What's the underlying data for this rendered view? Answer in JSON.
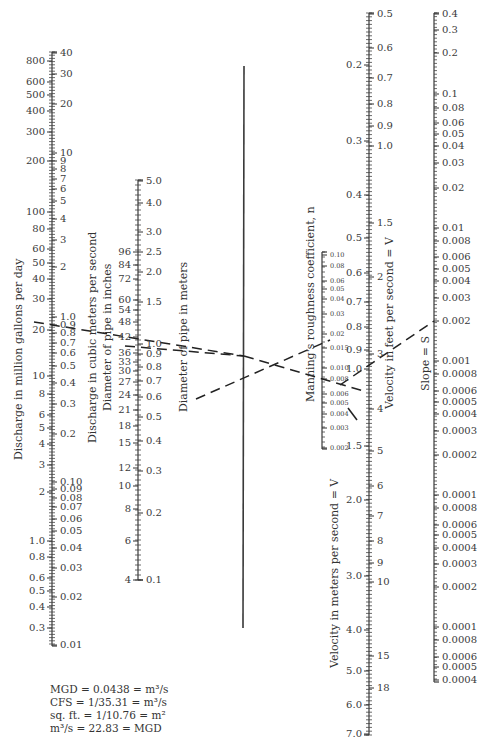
{
  "figure": {
    "type": "alignment-nomograph",
    "axes": [
      {
        "id": "discharge",
        "left_title": "Discharge in million gallons per day",
        "right_title": "Discharge in cubic meters per second",
        "left_ticks": [
          "800",
          "600",
          "500",
          "400",
          "300",
          "200",
          "100",
          "80",
          "60",
          "50",
          "40",
          "30",
          "20",
          "10",
          "8",
          "6",
          "5",
          "4",
          "3",
          "2",
          "1.0",
          "0.8",
          "0.6",
          "0.5",
          "0.4",
          "0.3"
        ],
        "right_ticks": [
          "40",
          "30",
          "20",
          "10",
          "9",
          "8",
          "7",
          "6",
          "5",
          "4",
          "3",
          "2",
          "1.0",
          "0.9",
          "0.8",
          "0.7",
          "0.6",
          "0.5",
          "0.4",
          "0.3",
          "0.2",
          "0.10",
          "0.09",
          "0.08",
          "0.07",
          "0.06",
          "0.05",
          "0.04",
          "0.03",
          "0.02",
          "0.01"
        ]
      },
      {
        "id": "pipe-diameter",
        "left_title": "Diameter of pipe in inches",
        "right_title": "Diameter of pipe in meters",
        "left_ticks": [
          "96",
          "84",
          "72",
          "60",
          "54",
          "48",
          "42",
          "36",
          "33",
          "30",
          "27",
          "24",
          "21",
          "18",
          "15",
          "12",
          "10",
          "8",
          "6",
          "4"
        ],
        "right_ticks": [
          "5.0",
          "4.0",
          "3.0",
          "2.5",
          "2.0",
          "1.5",
          "1.0",
          "0.9",
          "0.8",
          "0.7",
          "0.6",
          "0.5",
          "0.4",
          "0.3",
          "0.2",
          "0.1"
        ]
      },
      {
        "id": "turning-line",
        "left_title": "",
        "right_title": ""
      },
      {
        "id": "manning-n",
        "left_title": "Manning's roughness coefficient, n",
        "right_title": "",
        "right_ticks": [
          "0.10",
          "0.08",
          "0.06",
          "0.05",
          "0.04",
          "0.03",
          "0.02",
          "0.015",
          "0.010",
          "0.008",
          "0.006",
          "0.005",
          "0.004",
          "0.003",
          "0.002"
        ]
      },
      {
        "id": "velocity",
        "left_title": "Velocity in meters per second = V",
        "right_title": "Velocity in feet per second = V",
        "left_ticks": [
          "0.2",
          "0.3",
          "0.4",
          "0.5",
          "0.6",
          "0.7",
          "0.8",
          "0.9",
          "1.0",
          "1.5",
          "2.0",
          "3.0",
          "4.0",
          "5.0",
          "6.0",
          "7.0"
        ],
        "right_ticks": [
          "0.5",
          "0.6",
          "0.7",
          "0.8",
          "0.9",
          "1.0",
          "1.5",
          "2",
          "3",
          "4",
          "5",
          "6",
          "7",
          "8",
          "9",
          "10",
          "15",
          "18"
        ]
      },
      {
        "id": "slope",
        "left_title": "Slope = S",
        "right_ticks": [
          "0.4",
          "0.3",
          "0.2",
          "0.1",
          "0.08",
          "0.06",
          "0.05",
          "0.04",
          "0.03",
          "0.02",
          "0.01",
          "0.008",
          "0.006",
          "0.005",
          "0.004",
          "0.003",
          "0.002",
          "0.001",
          "0.0008",
          "0.0006",
          "0.0005",
          "0.0004",
          "0.0003",
          "0.0002",
          "0.0001",
          "0.0008",
          "0.0006",
          "0.0005",
          "0.0004",
          "0.0003",
          "0.0002",
          "0.0001",
          "0.0008",
          "0.0006",
          "0.0005",
          "0.0004"
        ]
      }
    ],
    "example_solution": {
      "discharge_mgd": "20",
      "discharge_m3s": "0.8",
      "pipe_diameter_in": "36",
      "pipe_diameter_m": "0.9",
      "manning_n": "0.013",
      "velocity_fps": "3",
      "velocity_mps": "0.9",
      "slope": "0.002"
    }
  },
  "titles": {
    "mgd": "Discharge in million gallons per day",
    "cms": "Discharge in cubic meters per second",
    "pipe_in": "Diameter of pipe in inches",
    "pipe_m": "Diameter of pipe in meters",
    "manning": "Manning's roughness coefficient, n",
    "vel_fps": "Velocity in feet per second = V",
    "vel_mps": "Velocity in meters per second = V",
    "slope": "Slope = S"
  },
  "notes": [
    "MGD = 0.0438 = m³/s",
    "CFS  = 1/35.31 = m³/s",
    "sq. ft. = 1/10.76 = m²",
    "m³/s  = 22.83 = MGD"
  ],
  "labels": {
    "mgd": [
      {
        "t": "800",
        "y": 61
      },
      {
        "t": "600",
        "y": 82
      },
      {
        "t": "500",
        "y": 95
      },
      {
        "t": "400",
        "y": 111
      },
      {
        "t": "300",
        "y": 132
      },
      {
        "t": "200",
        "y": 161
      },
      {
        "t": "100",
        "y": 212
      },
      {
        "t": "80",
        "y": 229
      },
      {
        "t": "60",
        "y": 249
      },
      {
        "t": "50",
        "y": 263
      },
      {
        "t": "40",
        "y": 279
      },
      {
        "t": "30",
        "y": 299
      },
      {
        "t": "20",
        "y": 330
      },
      {
        "t": "10",
        "y": 376
      },
      {
        "t": "8",
        "y": 394
      },
      {
        "t": "6",
        "y": 415
      },
      {
        "t": "5",
        "y": 428
      },
      {
        "t": "4",
        "y": 444
      },
      {
        "t": "3",
        "y": 465
      },
      {
        "t": "2",
        "y": 492
      },
      {
        "t": "1.0",
        "y": 541
      },
      {
        "t": "0.8",
        "y": 557
      },
      {
        "t": "0.6",
        "y": 578
      },
      {
        "t": "0.5",
        "y": 591
      },
      {
        "t": "0.4",
        "y": 607
      },
      {
        "t": "0.3",
        "y": 628
      }
    ],
    "cms": [
      {
        "t": "40",
        "y": 53
      },
      {
        "t": "30",
        "y": 74
      },
      {
        "t": "20",
        "y": 104
      },
      {
        "t": "10",
        "y": 153
      },
      {
        "t": "9",
        "y": 161
      },
      {
        "t": "8",
        "y": 169
      },
      {
        "t": "7",
        "y": 179
      },
      {
        "t": "6",
        "y": 189
      },
      {
        "t": "5",
        "y": 201
      },
      {
        "t": "4",
        "y": 219
      },
      {
        "t": "3",
        "y": 240
      },
      {
        "t": "2",
        "y": 267
      },
      {
        "t": "1.0",
        "y": 317
      },
      {
        "t": "0.9",
        "y": 325
      },
      {
        "t": "0.8",
        "y": 333
      },
      {
        "t": "0.7",
        "y": 343
      },
      {
        "t": "0.6",
        "y": 353
      },
      {
        "t": "0.5",
        "y": 366
      },
      {
        "t": "0.4",
        "y": 383
      },
      {
        "t": "0.3",
        "y": 404
      },
      {
        "t": "0.2",
        "y": 434
      },
      {
        "t": "0.10",
        "y": 482
      },
      {
        "t": "0.09",
        "y": 489
      },
      {
        "t": "0.08",
        "y": 498
      },
      {
        "t": "0.07",
        "y": 507
      },
      {
        "t": "0.06",
        "y": 519
      },
      {
        "t": "0.05",
        "y": 531
      },
      {
        "t": "0.04",
        "y": 548
      },
      {
        "t": "0.03",
        "y": 568
      },
      {
        "t": "0.02",
        "y": 597
      },
      {
        "t": "0.01",
        "y": 645
      }
    ],
    "pipe_in": [
      {
        "t": "96",
        "y": 252
      },
      {
        "t": "84",
        "y": 265
      },
      {
        "t": "72",
        "y": 279
      },
      {
        "t": "60",
        "y": 300
      },
      {
        "t": "54",
        "y": 310
      },
      {
        "t": "48",
        "y": 322
      },
      {
        "t": "42",
        "y": 337
      },
      {
        "t": "36",
        "y": 353
      },
      {
        "t": "33",
        "y": 362
      },
      {
        "t": "30",
        "y": 371
      },
      {
        "t": "27",
        "y": 382
      },
      {
        "t": "24",
        "y": 395
      },
      {
        "t": "21",
        "y": 410
      },
      {
        "t": "18",
        "y": 426
      },
      {
        "t": "15",
        "y": 443
      },
      {
        "t": "12",
        "y": 468
      },
      {
        "t": "10",
        "y": 486
      },
      {
        "t": "8",
        "y": 509
      },
      {
        "t": "6",
        "y": 541
      },
      {
        "t": "4",
        "y": 580
      }
    ],
    "pipe_m": [
      {
        "t": "5.0",
        "y": 181
      },
      {
        "t": "4.0",
        "y": 203
      },
      {
        "t": "3.0",
        "y": 232
      },
      {
        "t": "2.5",
        "y": 252
      },
      {
        "t": "2.0",
        "y": 272
      },
      {
        "t": "1.5",
        "y": 302
      },
      {
        "t": "1.0",
        "y": 344
      },
      {
        "t": "0.9",
        "y": 354
      },
      {
        "t": "0.8",
        "y": 367
      },
      {
        "t": "0.7",
        "y": 381
      },
      {
        "t": "0.6",
        "y": 397
      },
      {
        "t": "0.5",
        "y": 417
      },
      {
        "t": "0.4",
        "y": 441
      },
      {
        "t": "0.3",
        "y": 471
      },
      {
        "t": "0.2",
        "y": 513
      },
      {
        "t": "0.1",
        "y": 580
      }
    ],
    "manning": [
      {
        "t": "0.10",
        "y": 255
      },
      {
        "t": "0.08",
        "y": 266
      },
      {
        "t": "0.06",
        "y": 281
      },
      {
        "t": "0.05",
        "y": 289
      },
      {
        "t": "0.04",
        "y": 299
      },
      {
        "t": "0.03",
        "y": 314
      },
      {
        "t": "0.02",
        "y": 334
      },
      {
        "t": "0.015",
        "y": 348
      },
      {
        "t": "0.010",
        "y": 368
      },
      {
        "t": "0.008",
        "y": 379
      },
      {
        "t": "0.006",
        "y": 394
      },
      {
        "t": "0.005",
        "y": 403
      },
      {
        "t": "0.004",
        "y": 414
      },
      {
        "t": "0.003",
        "y": 428
      },
      {
        "t": "0.002",
        "y": 448
      }
    ],
    "vel_mps": [
      {
        "t": "0.2",
        "y": 65
      },
      {
        "t": "0.3",
        "y": 141
      },
      {
        "t": "0.4",
        "y": 195
      },
      {
        "t": "0.5",
        "y": 238
      },
      {
        "t": "0.6",
        "y": 273
      },
      {
        "t": "0.7",
        "y": 302
      },
      {
        "t": "0.8",
        "y": 327
      },
      {
        "t": "0.9",
        "y": 350
      },
      {
        "t": "1.0",
        "y": 369
      },
      {
        "t": "1.5",
        "y": 446
      },
      {
        "t": "2.0",
        "y": 500
      },
      {
        "t": "3.0",
        "y": 576
      },
      {
        "t": "4.0",
        "y": 630
      },
      {
        "t": "5.0",
        "y": 671
      },
      {
        "t": "6.0",
        "y": 705
      },
      {
        "t": "7.0",
        "y": 734
      }
    ],
    "vel_fps": [
      {
        "t": "0.5",
        "y": 14
      },
      {
        "t": "0.6",
        "y": 48
      },
      {
        "t": "0.7",
        "y": 78
      },
      {
        "t": "0.8",
        "y": 104
      },
      {
        "t": "0.9",
        "y": 126
      },
      {
        "t": "1.0",
        "y": 146
      },
      {
        "t": "1.5",
        "y": 223
      },
      {
        "t": "2",
        "y": 277
      },
      {
        "t": "3",
        "y": 354
      },
      {
        "t": "4",
        "y": 409
      },
      {
        "t": "5",
        "y": 451
      },
      {
        "t": "6",
        "y": 486
      },
      {
        "t": "7",
        "y": 516
      },
      {
        "t": "8",
        "y": 541
      },
      {
        "t": "9",
        "y": 563
      },
      {
        "t": "10",
        "y": 582
      },
      {
        "t": "15",
        "y": 656
      },
      {
        "t": "18",
        "y": 688
      }
    ],
    "slope": [
      {
        "t": "0.4",
        "y": 14
      },
      {
        "t": "0.3",
        "y": 30
      },
      {
        "t": "0.2",
        "y": 53
      },
      {
        "t": "0.1",
        "y": 94
      },
      {
        "t": "0.08",
        "y": 108
      },
      {
        "t": "0.06",
        "y": 123
      },
      {
        "t": "0.05",
        "y": 134
      },
      {
        "t": "0.04",
        "y": 146
      },
      {
        "t": "0.03",
        "y": 163
      },
      {
        "t": "0.02",
        "y": 188
      },
      {
        "t": "0.01",
        "y": 228
      },
      {
        "t": "0.008",
        "y": 241
      },
      {
        "t": "0.006",
        "y": 257
      },
      {
        "t": "0.005",
        "y": 269
      },
      {
        "t": "0.004",
        "y": 281
      },
      {
        "t": "0.003",
        "y": 298
      },
      {
        "t": "0.002",
        "y": 321
      },
      {
        "t": "0.001",
        "y": 361
      },
      {
        "t": "0.0008",
        "y": 374
      },
      {
        "t": "0.0006",
        "y": 391
      },
      {
        "t": "0.0005",
        "y": 402
      },
      {
        "t": "0.0004",
        "y": 414
      },
      {
        "t": "0.0003",
        "y": 431
      },
      {
        "t": "0.0002",
        "y": 455
      },
      {
        "t": "0.0001",
        "y": 495
      },
      {
        "t": "0.0008",
        "y": 508
      },
      {
        "t": "0.0006",
        "y": 525
      },
      {
        "t": "0.0005",
        "y": 535
      },
      {
        "t": "0.0004",
        "y": 548
      },
      {
        "t": "0.0003",
        "y": 564
      },
      {
        "t": "0.0002",
        "y": 587
      },
      {
        "t": "0.0001",
        "y": 627
      },
      {
        "t": "0.0008",
        "y": 640
      },
      {
        "t": "0.0006",
        "y": 657
      },
      {
        "t": "0.0005",
        "y": 667
      },
      {
        "t": "0.0004",
        "y": 680
      }
    ]
  }
}
